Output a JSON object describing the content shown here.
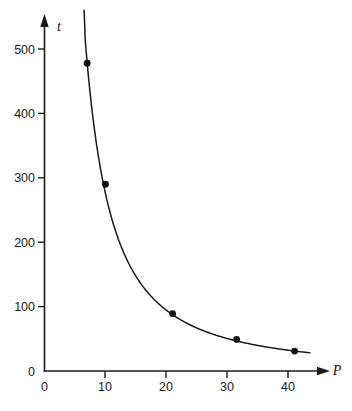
{
  "chart_data": {
    "type": "scatter",
    "title": "",
    "subtitle": "",
    "xlabel": "P",
    "ylabel": "t",
    "xlim": [
      0,
      44
    ],
    "ylim": [
      0,
      560
    ],
    "grid": false,
    "legend": "none",
    "x_ticks": [
      0,
      10,
      20,
      30,
      40
    ],
    "x_tick_labels": [
      "0",
      "10",
      "20",
      "30",
      "40"
    ],
    "y_ticks": [
      0,
      100,
      200,
      300,
      400,
      500
    ],
    "y_tick_labels": [
      "0",
      "100",
      "200",
      "300",
      "400",
      "500"
    ],
    "origin_label": "0",
    "series": [
      {
        "name": "t vs P",
        "marker": "filled-circle",
        "line": "smooth-decay-curve",
        "x": [
          7,
          10,
          21,
          31.5,
          41
        ],
        "y": [
          478,
          290,
          89,
          49,
          31
        ],
        "points": [
          {
            "P": 7,
            "t": 478
          },
          {
            "P": 10,
            "t": 290
          },
          {
            "P": 21,
            "t": 89
          },
          {
            "P": 31.5,
            "t": 49
          },
          {
            "P": 41,
            "t": 31
          }
        ]
      }
    ],
    "curve": {
      "description": "inverse-power decay curve through the plotted points",
      "x_start": 6.5,
      "x_end": 43.5,
      "y_start": 560,
      "y_end": 29
    },
    "annotations": []
  },
  "figure": {
    "caption": "",
    "y_axis_symbol": "t",
    "x_axis_symbol": "P"
  }
}
